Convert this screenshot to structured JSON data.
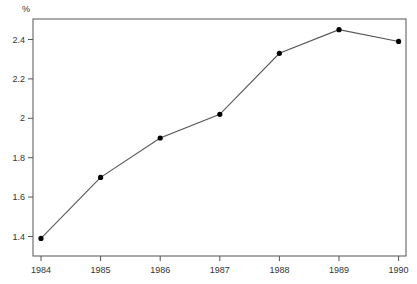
{
  "chart_data": {
    "type": "line",
    "title": "",
    "xlabel": "",
    "ylabel": "%",
    "categories": [
      "1984",
      "1985",
      "1986",
      "1987",
      "1988",
      "1989",
      "1990"
    ],
    "series": [
      {
        "name": "value",
        "values": [
          1.39,
          1.7,
          1.9,
          2.02,
          2.33,
          2.45,
          2.39
        ]
      }
    ],
    "yticks": [
      1.4,
      1.6,
      1.8,
      2,
      2.2,
      2.4
    ],
    "ytick_labels": [
      "1.4",
      "1.6",
      "1.8",
      "2",
      "2.2",
      "2.4"
    ],
    "ylim": [
      1.3,
      2.51
    ],
    "grid": false,
    "legend": null,
    "markers": "filled-circle",
    "colors": {
      "line": "#555555",
      "marker": "#000000",
      "axis": "#555555"
    }
  }
}
